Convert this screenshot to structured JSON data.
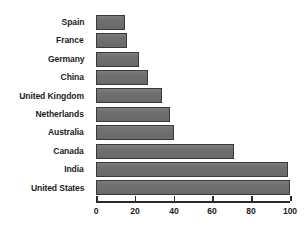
{
  "chart_data": {
    "type": "bar",
    "orientation": "horizontal",
    "title": "",
    "subtitle": "",
    "xlabel": "",
    "ylabel": "",
    "xlim": [
      0,
      100
    ],
    "xticks": [
      0,
      20,
      40,
      60,
      80,
      100
    ],
    "xtick_labels": [
      "0",
      "20",
      "40",
      "60",
      "80",
      "100"
    ],
    "grid": false,
    "legend": false,
    "legend_position": "none",
    "categories": [
      "Spain",
      "France",
      "Germany",
      "China",
      "United Kingdom",
      "Netherlands",
      "Australia",
      "Canada",
      "India",
      "United States"
    ],
    "values": [
      15,
      16,
      22,
      27,
      34,
      38,
      40,
      71,
      99,
      100
    ],
    "series": [
      {
        "name": "",
        "values": [
          15,
          16,
          22,
          27,
          34,
          38,
          40,
          71,
          99,
          100
        ]
      }
    ],
    "colors": {
      "bar_fill": "#6e6e6e",
      "bar_border": "#3a3a3a",
      "axis": "#2b2b2b",
      "text": "#1c1c1c",
      "background": "#ffffff"
    }
  }
}
